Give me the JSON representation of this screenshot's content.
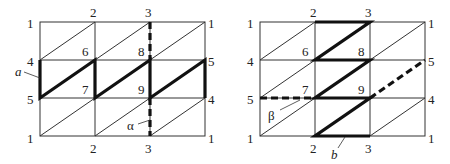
{
  "diagram": {
    "panels": [
      {
        "id": "left",
        "grid": {
          "cols_x": [
            40,
            95,
            150,
            205
          ],
          "rows_y": [
            22,
            60,
            98,
            136
          ]
        },
        "node_labels": [
          {
            "text": "1",
            "x": 27,
            "y": 28
          },
          {
            "text": "2",
            "x": 90,
            "y": 17
          },
          {
            "text": "3",
            "x": 145,
            "y": 17
          },
          {
            "text": "1",
            "x": 208,
            "y": 28
          },
          {
            "text": "4",
            "x": 27,
            "y": 66
          },
          {
            "text": "6",
            "x": 82,
            "y": 56
          },
          {
            "text": "8",
            "x": 138,
            "y": 56
          },
          {
            "text": "5",
            "x": 208,
            "y": 66
          },
          {
            "text": "5",
            "x": 27,
            "y": 104
          },
          {
            "text": "7",
            "x": 82,
            "y": 94
          },
          {
            "text": "9",
            "x": 138,
            "y": 94
          },
          {
            "text": "4",
            "x": 208,
            "y": 104
          },
          {
            "text": "1",
            "x": 27,
            "y": 143
          },
          {
            "text": "2",
            "x": 90,
            "y": 153
          },
          {
            "text": "3",
            "x": 145,
            "y": 153
          },
          {
            "text": "1",
            "x": 208,
            "y": 143
          }
        ],
        "annotations": [
          {
            "text": "a",
            "x": 15,
            "y": 80,
            "italic": true
          },
          {
            "text": "α",
            "x": 128,
            "y": 129,
            "italic": false
          }
        ]
      },
      {
        "id": "right",
        "grid": {
          "cols_x": [
            260,
            315,
            370,
            425
          ],
          "rows_y": [
            22,
            60,
            98,
            136
          ]
        },
        "node_labels": [
          {
            "text": "1",
            "x": 247,
            "y": 28
          },
          {
            "text": "2",
            "x": 310,
            "y": 17
          },
          {
            "text": "3",
            "x": 365,
            "y": 17
          },
          {
            "text": "1",
            "x": 428,
            "y": 28
          },
          {
            "text": "4",
            "x": 247,
            "y": 66
          },
          {
            "text": "6",
            "x": 302,
            "y": 56
          },
          {
            "text": "8",
            "x": 358,
            "y": 56
          },
          {
            "text": "5",
            "x": 428,
            "y": 66
          },
          {
            "text": "5",
            "x": 247,
            "y": 104
          },
          {
            "text": "7",
            "x": 302,
            "y": 94
          },
          {
            "text": "9",
            "x": 358,
            "y": 94
          },
          {
            "text": "4",
            "x": 428,
            "y": 104
          },
          {
            "text": "1",
            "x": 247,
            "y": 143
          },
          {
            "text": "2",
            "x": 310,
            "y": 153
          },
          {
            "text": "3",
            "x": 365,
            "y": 153
          },
          {
            "text": "1",
            "x": 428,
            "y": 143
          }
        ],
        "annotations": [
          {
            "text": "β",
            "x": 268,
            "y": 120,
            "italic": false
          },
          {
            "text": "b",
            "x": 333,
            "y": 159,
            "italic": true
          }
        ]
      }
    ]
  }
}
